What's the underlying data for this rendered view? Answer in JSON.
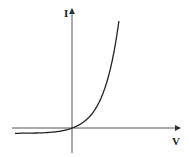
{
  "chart_data": {
    "type": "line",
    "title": "",
    "xlabel": "V",
    "ylabel": "I",
    "grid": false,
    "legend": "none",
    "series": [
      {
        "name": "I(V)",
        "x": [
          -1.0,
          -0.8,
          -0.6,
          -0.4,
          -0.2,
          0.0,
          0.1,
          0.2,
          0.3,
          0.4,
          0.5,
          0.6,
          0.7
        ],
        "y": [
          -0.05,
          -0.05,
          -0.049,
          -0.045,
          -0.035,
          0.0,
          0.09,
          0.22,
          0.39,
          0.58,
          0.76,
          0.92,
          1.0
        ]
      }
    ],
    "xlim": [
      -1.0,
      1.0
    ],
    "ylim": [
      -0.2,
      1.1
    ]
  }
}
